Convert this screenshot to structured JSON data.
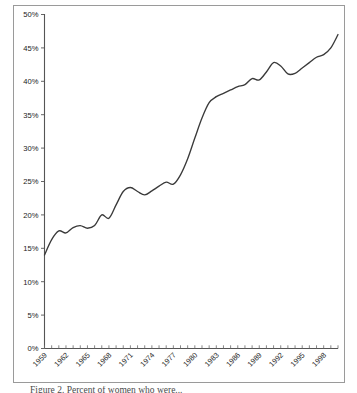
{
  "chart_data": {
    "type": "line",
    "title": "",
    "xlabel": "",
    "ylabel": "",
    "ylim": [
      0,
      50
    ],
    "xlim": [
      1959,
      2000
    ],
    "grid": false,
    "legend": null,
    "y_tick_labels": [
      "0%",
      "5%",
      "10%",
      "15%",
      "20%",
      "25%",
      "30%",
      "35%",
      "40%",
      "45%",
      "50%"
    ],
    "y_tick_values": [
      0,
      5,
      10,
      15,
      20,
      25,
      30,
      35,
      40,
      45,
      50
    ],
    "x_tick_labels": [
      "1959",
      "1962",
      "1965",
      "1968",
      "1971",
      "1974",
      "1977",
      "1980",
      "1983",
      "1986",
      "1989",
      "1992",
      "1995",
      "1998"
    ],
    "x_tick_label_values": [
      1959,
      1962,
      1965,
      1968,
      1971,
      1974,
      1977,
      1980,
      1983,
      1986,
      1989,
      1992,
      1995,
      1998
    ],
    "x_minor_ticks_interval": 1,
    "x": [
      1959,
      1960,
      1961,
      1962,
      1963,
      1964,
      1965,
      1966,
      1967,
      1968,
      1969,
      1970,
      1971,
      1972,
      1973,
      1974,
      1975,
      1976,
      1977,
      1978,
      1979,
      1980,
      1981,
      1982,
      1983,
      1984,
      1985,
      1986,
      1987,
      1988,
      1989,
      1990,
      1991,
      1992,
      1993,
      1994,
      1995,
      1996,
      1997,
      1998,
      1999,
      2000
    ],
    "values": [
      14.0,
      16.3,
      17.6,
      17.3,
      18.1,
      18.4,
      18.0,
      18.4,
      20.0,
      19.5,
      21.5,
      23.5,
      24.1,
      23.5,
      23.0,
      23.6,
      24.3,
      24.9,
      24.6,
      26.0,
      28.4,
      31.5,
      34.5,
      36.8,
      37.7,
      38.2,
      38.7,
      39.2,
      39.5,
      40.4,
      40.2,
      41.4,
      42.8,
      42.3,
      41.1,
      41.2,
      42.0,
      42.8,
      43.6,
      44.0,
      45.0,
      47.0
    ],
    "series_name": "",
    "line_color": "#3a3a3a"
  },
  "figure": {
    "frame_color": "#9a9a9a",
    "background": "#ffffff",
    "caption_partial": "Figure 2.  Percent of women who were..."
  }
}
